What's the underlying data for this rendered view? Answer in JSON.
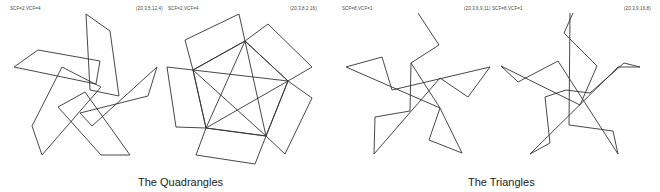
{
  "panels": [
    {
      "id": "quad-1",
      "params_label": "SCF=2,VCF=4",
      "tuple_label": "(20,3,5,12,4)"
    },
    {
      "id": "quad-2",
      "params_label": "SCF=2,VCF=4",
      "tuple_label": "(20,3,8,2,16)"
    },
    {
      "id": "tri-1",
      "params_label": "SCF=8,VCF=1",
      "tuple_label": "(20,3,6,9,11)"
    },
    {
      "id": "tri-2",
      "params_label": "SCF=8,VCF=1",
      "tuple_label": "(20,3,9,16,8)"
    }
  ],
  "captions": {
    "left": "The Quadrangles",
    "right": "The Triangles"
  },
  "colors": {
    "stroke": "#333333",
    "background": "#ffffff"
  }
}
